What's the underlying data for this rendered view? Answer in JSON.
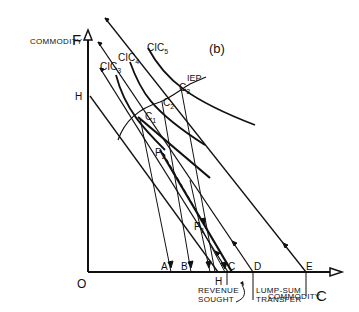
{
  "figure": {
    "panel_label": "(b)",
    "axes": {
      "y_label": "COMMODITY",
      "y_symbol": "F",
      "x_label": "COMMODITY",
      "x_symbol": "C",
      "origin": "O"
    },
    "curves": {
      "cic3": {
        "base": "CIC",
        "sub": "3"
      },
      "cic4": {
        "base": "CIC",
        "sub": "4"
      },
      "cic5": {
        "base": "CIC",
        "sub": "5"
      },
      "iep": "IEP"
    },
    "points": {
      "h_vertical": "H",
      "c1": {
        "base": "C",
        "sub": "1"
      },
      "c2": {
        "base": "C",
        "sub": "2"
      },
      "c3": {
        "base": "C",
        "sub": "3"
      },
      "p1": {
        "base": "P",
        "sub": "1"
      },
      "p2": {
        "base": "P",
        "sub": "2"
      },
      "a": "A",
      "b": "B",
      "c": "C",
      "d": "D",
      "e": "E",
      "h_horizontal": "H"
    },
    "annotations": {
      "revenue_line1": "REVENUE",
      "revenue_line2": "SOUGHT",
      "lumpsum_line1": "LUMP-SUM",
      "lumpsum_line2": "TRANSFER"
    },
    "colors": {
      "ink": "#111111",
      "background": "#ffffff"
    }
  }
}
